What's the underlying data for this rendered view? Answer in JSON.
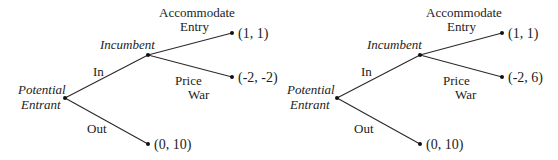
{
  "trees": [
    {
      "root_player": [
        "Potential",
        "Entrant"
      ],
      "second_player": "Incumbent",
      "actions": {
        "in": "In",
        "out": "Out",
        "accommodate": [
          "Accommodate",
          "Entry"
        ],
        "price_war": [
          "Price",
          "War"
        ]
      },
      "payoffs": {
        "accommodate": "(1, 1)",
        "price_war": "(-2, -2)",
        "out": "(0, 10)"
      }
    },
    {
      "root_player": [
        "Potential",
        "Entrant"
      ],
      "second_player": "Incumbent",
      "actions": {
        "in": "In",
        "out": "Out",
        "accommodate": [
          "Accommodate",
          "Entry"
        ],
        "price_war": [
          "Price",
          "War"
        ]
      },
      "payoffs": {
        "accommodate": "(1, 1)",
        "price_war": "(-2, 6)",
        "out": "(0, 10)"
      }
    }
  ]
}
